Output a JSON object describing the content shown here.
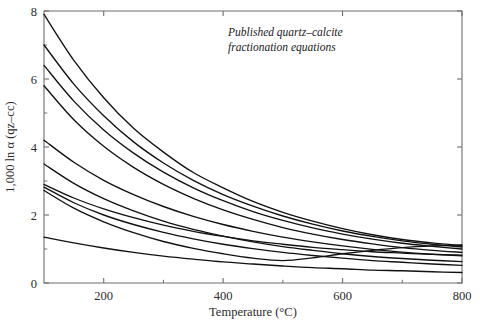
{
  "chart_data": {
    "type": "line",
    "title": "",
    "annotation": [
      "Published quartz–calcite",
      "fractionation equations"
    ],
    "xlabel": "Temperature (°C)",
    "ylabel": "1,000 ln α (qz–cc)",
    "xlim": [
      100,
      800
    ],
    "ylim": [
      0,
      8
    ],
    "xticks": [
      200,
      400,
      600,
      800
    ],
    "xticklabels": [
      "200",
      "400",
      "600",
      "800"
    ],
    "xticks_minor": [
      300,
      500,
      700
    ],
    "yticks": [
      0,
      2,
      4,
      6,
      8
    ],
    "yticklabels": [
      "0",
      "2",
      "4",
      "6",
      "8"
    ],
    "yticks_minor": [
      1,
      3,
      5,
      7
    ],
    "grid": false,
    "legend": null,
    "line_color": "#111111",
    "axis_color": "#6d6d6d",
    "background": "#ffffff",
    "x": [
      100,
      150,
      200,
      250,
      300,
      350,
      400,
      450,
      500,
      550,
      600,
      650,
      700,
      750,
      800
    ],
    "series": [
      {
        "name": "curve-1",
        "values": [
          7.9,
          6.55,
          5.45,
          4.55,
          3.85,
          3.25,
          2.8,
          2.4,
          2.08,
          1.82,
          1.6,
          1.42,
          1.28,
          1.18,
          1.1
        ]
      },
      {
        "name": "curve-2",
        "values": [
          7.0,
          5.85,
          4.92,
          4.15,
          3.53,
          3.02,
          2.6,
          2.26,
          1.97,
          1.73,
          1.53,
          1.37,
          1.24,
          1.14,
          1.06
        ]
      },
      {
        "name": "curve-3",
        "values": [
          6.4,
          5.35,
          4.5,
          3.82,
          3.26,
          2.8,
          2.42,
          2.1,
          1.84,
          1.62,
          1.44,
          1.29,
          1.17,
          1.08,
          1.0
        ]
      },
      {
        "name": "curve-4",
        "values": [
          5.8,
          4.8,
          4.02,
          3.4,
          2.9,
          2.49,
          2.15,
          1.87,
          1.63,
          1.44,
          1.28,
          1.15,
          1.04,
          0.96,
          0.9
        ]
      },
      {
        "name": "curve-5",
        "values": [
          4.2,
          3.55,
          3.02,
          2.6,
          2.25,
          1.96,
          1.72,
          1.52,
          1.35,
          1.21,
          1.09,
          0.99,
          0.91,
          0.85,
          0.8
        ]
      },
      {
        "name": "curve-6",
        "values": [
          3.5,
          2.93,
          2.48,
          2.12,
          1.82,
          1.58,
          1.38,
          1.21,
          1.07,
          0.96,
          0.86,
          0.78,
          0.72,
          0.67,
          0.63
        ]
      },
      {
        "name": "curve-7",
        "values": [
          2.9,
          2.5,
          2.18,
          1.92,
          1.7,
          1.52,
          1.37,
          1.24,
          1.14,
          1.05,
          0.98,
          0.92,
          0.88,
          0.84,
          0.82
        ]
      },
      {
        "name": "curve-8",
        "values": [
          2.82,
          2.36,
          2.0,
          1.72,
          1.49,
          1.3,
          1.14,
          1.01,
          0.9,
          0.81,
          0.73,
          0.66,
          0.61,
          0.56,
          0.52
        ]
      },
      {
        "name": "curve-9",
        "values": [
          2.72,
          2.2,
          1.8,
          1.48,
          1.22,
          1.02,
          0.86,
          0.73,
          0.66,
          0.74,
          0.86,
          0.96,
          1.04,
          1.09,
          1.12
        ]
      },
      {
        "name": "curve-10",
        "values": [
          1.35,
          1.18,
          1.03,
          0.9,
          0.79,
          0.7,
          0.62,
          0.56,
          0.5,
          0.45,
          0.42,
          0.38,
          0.36,
          0.33,
          0.31
        ]
      }
    ]
  }
}
